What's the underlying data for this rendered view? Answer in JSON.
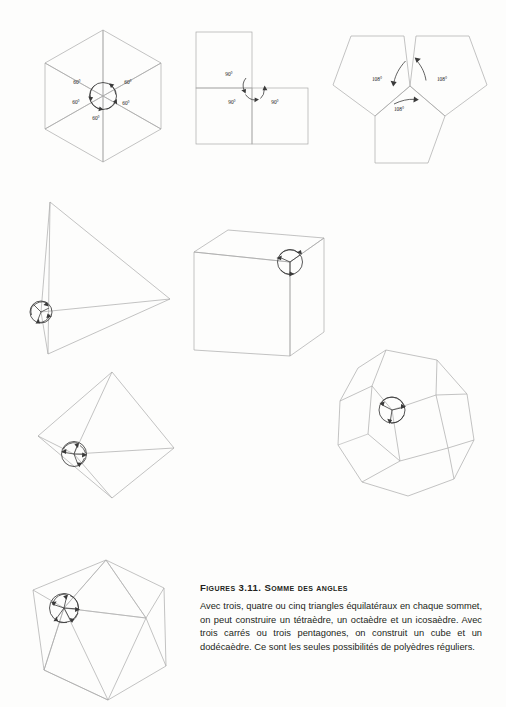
{
  "page": {
    "background": "#fdfdfc",
    "line_color": "#a9a9a9",
    "annotation_color": "#3a3a3a"
  },
  "figures": [
    {
      "id": "equilateral-triangles-net",
      "name": "five-equilateral-triangles-around-vertex",
      "description": "Five equilateral triangles meeting at a common vertex leaving a gap",
      "angle_labels": [
        "60°",
        "60°",
        "60°",
        "60°",
        "60°"
      ],
      "angle_value": "60°",
      "count": 5
    },
    {
      "id": "squares-net",
      "name": "three-squares-around-vertex",
      "description": "Three squares meeting at a common vertex leaving a gap",
      "angle_labels": [
        "90°",
        "90°",
        "90°"
      ],
      "angle_value": "90°",
      "count": 3
    },
    {
      "id": "pentagons-net",
      "name": "three-pentagons-around-vertex",
      "description": "Three regular pentagons meeting at a common vertex leaving a gap",
      "angle_labels": [
        "108°",
        "108°",
        "108°"
      ],
      "angle_value": "108°",
      "count": 3
    },
    {
      "id": "tetrahedron",
      "name": "tetrahedron",
      "description": "Tetrahedron with highlighted vertex circle"
    },
    {
      "id": "cube",
      "name": "cube",
      "description": "Cube with highlighted vertex circle"
    },
    {
      "id": "octahedron",
      "name": "octahedron",
      "description": "Octahedron with highlighted vertex circle"
    },
    {
      "id": "dodecahedron",
      "name": "dodecahedron",
      "description": "Dodecahedron with highlighted vertex circle"
    },
    {
      "id": "icosahedron",
      "name": "icosahedron",
      "description": "Icosahedron with highlighted vertex circle"
    }
  ],
  "caption": {
    "title": "Figures 3.11. Somme des angles",
    "body": "Avec trois, quatre ou cinq triangles équilatéraux en chaque sommet, on peut construire un tétraèdre, un octaèdre et un icosaèdre. Avec trois carrés ou trois pentagones, on construit un cube et un dodécaèdre. Ce sont les seules possibilités de polyèdres réguliers."
  }
}
